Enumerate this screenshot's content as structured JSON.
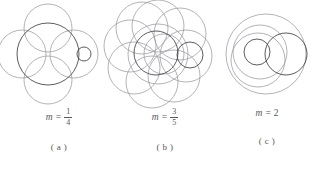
{
  "figure": {
    "type": "math-diagram",
    "stroke_dark": "#4a4a50",
    "stroke_light": "#9a9aa2",
    "text_color": "#58585c",
    "background": "#ffffff",
    "panels": [
      {
        "id": "a",
        "sub_caption": "( a )",
        "m_prefix": "m",
        "m_equals": "=",
        "m_kind": "fraction",
        "m_numerator": "1",
        "m_denominator": "4",
        "m_value": "1/4",
        "circle_count_light": 4,
        "circle_count_dark": 2
      },
      {
        "id": "b",
        "sub_caption": "( b )",
        "m_prefix": "m",
        "m_equals": "=",
        "m_kind": "fraction",
        "m_numerator": "3",
        "m_denominator": "5",
        "m_value": "3/5",
        "circle_count_light": 10,
        "circle_count_dark": 2
      },
      {
        "id": "c",
        "sub_caption": "( c )",
        "m_prefix": "m",
        "m_equals": "=",
        "m_kind": "whole",
        "m_numerator": "2",
        "m_denominator": "",
        "m_value": "2",
        "circle_count_light": 3,
        "circle_count_dark": 2
      }
    ]
  }
}
